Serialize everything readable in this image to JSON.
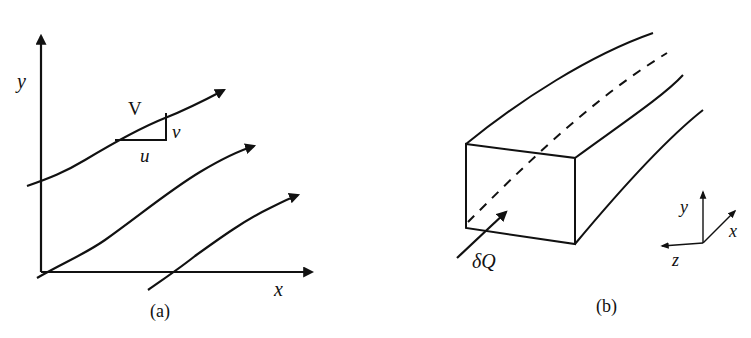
{
  "panels": [
    {
      "id": "a",
      "caption": "(a)",
      "axes": {
        "x_label": "x",
        "y_label": "y"
      },
      "velocity_label": "V",
      "component_u": "u",
      "component_v": "v",
      "streamline_count": 3
    },
    {
      "id": "b",
      "caption": "(b)",
      "flow_label": "δQ",
      "triad": {
        "x": "x",
        "y": "y",
        "z": "z"
      },
      "description": "Stream tube with rectangular cross-section and dashed central streamline"
    }
  ],
  "colors": {
    "stroke": "#111111",
    "background": "#ffffff"
  }
}
